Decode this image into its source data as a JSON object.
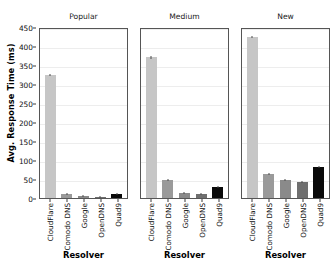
{
  "chart_data": {
    "type": "bar",
    "title": "",
    "ylabel": "Avg. Response Time (ms)",
    "xlabel": "Resolver",
    "ylim": [
      0,
      450
    ],
    "yticks": [
      0,
      50,
      100,
      150,
      200,
      250,
      300,
      350,
      400,
      450
    ],
    "grid": true,
    "legend": "none",
    "categories": [
      "CloudFlare",
      "Comodo DNS",
      "Google",
      "OpenDNS",
      "Quad9"
    ],
    "panels": [
      {
        "title": "Popular",
        "xlabel": "Resolver",
        "values": [
          324,
          10,
          6,
          3,
          11
        ],
        "errors": [
          3,
          0.5,
          0.4,
          0.3,
          0.5
        ]
      },
      {
        "title": "Medium",
        "xlabel": "Resolver",
        "values": [
          370,
          47,
          14,
          10,
          29
        ],
        "errors": [
          3,
          1,
          0.6,
          0.5,
          1
        ]
      },
      {
        "title": "New",
        "xlabel": "Resolver",
        "values": [
          424,
          62,
          47,
          43,
          81
        ],
        "errors": [
          3,
          1.2,
          1,
          1,
          1.5
        ]
      }
    ],
    "bar_colors": [
      "#c6c6c6",
      "#9a9a9a",
      "#8a8a8a",
      "#6f6f6f",
      "#0a0a0a"
    ]
  }
}
